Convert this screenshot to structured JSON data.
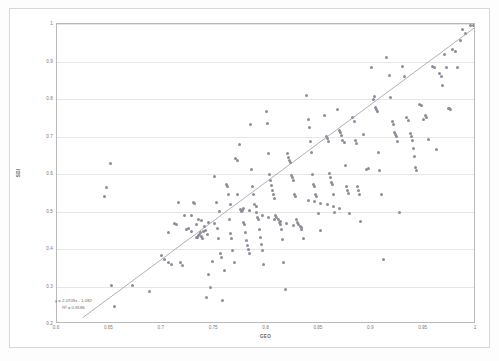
{
  "chart_data": {
    "type": "scatter",
    "title": "",
    "xlabel": "GEO",
    "ylabel": "SDI",
    "xlim": [
      0.6,
      1
    ],
    "ylim": [
      0.2,
      1
    ],
    "grid": true,
    "legend": "none",
    "x_ticks": [
      "0.6",
      "0.65",
      "0.7",
      "0.75",
      "0.8",
      "0.85",
      "0.9",
      "0.95",
      "1"
    ],
    "y_ticks": [
      "0.2",
      "0.3",
      "0.4",
      "0.5",
      "0.6",
      "0.7",
      "0.8",
      "0.9",
      "1"
    ],
    "marker_color": "#8d8d99",
    "trendline_color": "#9a9aa6",
    "gridline_color": "#e6e6e6",
    "annotations": {
      "equation": "y = 2.0709x - 1.082",
      "r_squared": "R² = 0.8186"
    },
    "trendline": {
      "type": "linear",
      "slope": 2.0709,
      "intercept": -1.082,
      "x_start": 0.6245,
      "x_end": 1.0
    },
    "points": [
      [
        0.651,
        0.628
      ],
      [
        0.647,
        0.565
      ],
      [
        0.645,
        0.54
      ],
      [
        0.652,
        0.303
      ],
      [
        0.655,
        0.247
      ],
      [
        0.655,
        0.201
      ],
      [
        0.672,
        0.302
      ],
      [
        0.688,
        0.288
      ],
      [
        0.7,
        0.382
      ],
      [
        0.703,
        0.371
      ],
      [
        0.706,
        0.363
      ],
      [
        0.709,
        0.359
      ],
      [
        0.712,
        0.469
      ],
      [
        0.714,
        0.466
      ],
      [
        0.716,
        0.525
      ],
      [
        0.718,
        0.364
      ],
      [
        0.72,
        0.356
      ],
      [
        0.722,
        0.49
      ],
      [
        0.724,
        0.452
      ],
      [
        0.726,
        0.455
      ],
      [
        0.728,
        0.448
      ],
      [
        0.73,
        0.525
      ],
      [
        0.731,
        0.522
      ],
      [
        0.733,
        0.432
      ],
      [
        0.734,
        0.43
      ],
      [
        0.735,
        0.437
      ],
      [
        0.736,
        0.44
      ],
      [
        0.737,
        0.443
      ],
      [
        0.738,
        0.434
      ],
      [
        0.739,
        0.429
      ],
      [
        0.74,
        0.447
      ],
      [
        0.741,
        0.459
      ],
      [
        0.742,
        0.45
      ],
      [
        0.743,
        0.27
      ],
      [
        0.745,
        0.333
      ],
      [
        0.747,
        0.298
      ],
      [
        0.748,
        0.368
      ],
      [
        0.75,
        0.594
      ],
      [
        0.752,
        0.525
      ],
      [
        0.753,
        0.455
      ],
      [
        0.754,
        0.429
      ],
      [
        0.756,
        0.389
      ],
      [
        0.757,
        0.378
      ],
      [
        0.758,
        0.262
      ],
      [
        0.76,
        0.343
      ],
      [
        0.762,
        0.573
      ],
      [
        0.763,
        0.566
      ],
      [
        0.764,
        0.545
      ],
      [
        0.765,
        0.478
      ],
      [
        0.766,
        0.441
      ],
      [
        0.767,
        0.428
      ],
      [
        0.768,
        0.396
      ],
      [
        0.769,
        0.363
      ],
      [
        0.77,
        0.642
      ],
      [
        0.772,
        0.637
      ],
      [
        0.774,
        0.679
      ],
      [
        0.775,
        0.506
      ],
      [
        0.776,
        0.5
      ],
      [
        0.777,
        0.503
      ],
      [
        0.778,
        0.472
      ],
      [
        0.779,
        0.465
      ],
      [
        0.78,
        0.443
      ],
      [
        0.781,
        0.423
      ],
      [
        0.782,
        0.409
      ],
      [
        0.783,
        0.398
      ],
      [
        0.784,
        0.387
      ],
      [
        0.785,
        0.733
      ],
      [
        0.786,
        0.613
      ],
      [
        0.787,
        0.568
      ],
      [
        0.788,
        0.545
      ],
      [
        0.789,
        0.519
      ],
      [
        0.79,
        0.513
      ],
      [
        0.791,
        0.485
      ],
      [
        0.792,
        0.478
      ],
      [
        0.793,
        0.452
      ],
      [
        0.794,
        0.432
      ],
      [
        0.795,
        0.411
      ],
      [
        0.796,
        0.395
      ],
      [
        0.797,
        0.36
      ],
      [
        0.8,
        0.766
      ],
      [
        0.801,
        0.735
      ],
      [
        0.802,
        0.654
      ],
      [
        0.803,
        0.6
      ],
      [
        0.804,
        0.583
      ],
      [
        0.805,
        0.57
      ],
      [
        0.806,
        0.556
      ],
      [
        0.807,
        0.545
      ],
      [
        0.808,
        0.536
      ],
      [
        0.809,
        0.49
      ],
      [
        0.81,
        0.484
      ],
      [
        0.811,
        0.478
      ],
      [
        0.812,
        0.472
      ],
      [
        0.813,
        0.465
      ],
      [
        0.814,
        0.452
      ],
      [
        0.815,
        0.425
      ],
      [
        0.816,
        0.365
      ],
      [
        0.818,
        0.292
      ],
      [
        0.82,
        0.656
      ],
      [
        0.821,
        0.643
      ],
      [
        0.822,
        0.636
      ],
      [
        0.823,
        0.63
      ],
      [
        0.824,
        0.597
      ],
      [
        0.825,
        0.59
      ],
      [
        0.826,
        0.584
      ],
      [
        0.827,
        0.545
      ],
      [
        0.828,
        0.54
      ],
      [
        0.829,
        0.478
      ],
      [
        0.83,
        0.472
      ],
      [
        0.831,
        0.465
      ],
      [
        0.832,
        0.459
      ],
      [
        0.833,
        0.452
      ],
      [
        0.835,
        0.427
      ],
      [
        0.838,
        0.81
      ],
      [
        0.84,
        0.745
      ],
      [
        0.841,
        0.724
      ],
      [
        0.842,
        0.686
      ],
      [
        0.843,
        0.658
      ],
      [
        0.844,
        0.6
      ],
      [
        0.845,
        0.573
      ],
      [
        0.846,
        0.566
      ],
      [
        0.847,
        0.545
      ],
      [
        0.848,
        0.539
      ],
      [
        0.85,
        0.494
      ],
      [
        0.852,
        0.45
      ],
      [
        0.855,
        0.757
      ],
      [
        0.857,
        0.7
      ],
      [
        0.858,
        0.694
      ],
      [
        0.859,
        0.688
      ],
      [
        0.86,
        0.601
      ],
      [
        0.861,
        0.59
      ],
      [
        0.862,
        0.578
      ],
      [
        0.863,
        0.572
      ],
      [
        0.864,
        0.545
      ],
      [
        0.865,
        0.497
      ],
      [
        0.868,
        0.772
      ],
      [
        0.87,
        0.716
      ],
      [
        0.871,
        0.71
      ],
      [
        0.872,
        0.703
      ],
      [
        0.873,
        0.69
      ],
      [
        0.874,
        0.684
      ],
      [
        0.875,
        0.622
      ],
      [
        0.876,
        0.566
      ],
      [
        0.877,
        0.556
      ],
      [
        0.878,
        0.547
      ],
      [
        0.879,
        0.496
      ],
      [
        0.882,
        0.752
      ],
      [
        0.884,
        0.74
      ],
      [
        0.885,
        0.69
      ],
      [
        0.886,
        0.682
      ],
      [
        0.887,
        0.566
      ],
      [
        0.888,
        0.556
      ],
      [
        0.889,
        0.545
      ],
      [
        0.89,
        0.473
      ],
      [
        0.893,
        0.706
      ],
      [
        0.895,
        0.613
      ],
      [
        0.897,
        0.615
      ],
      [
        0.9,
        0.885
      ],
      [
        0.902,
        0.8
      ],
      [
        0.903,
        0.806
      ],
      [
        0.904,
        0.777
      ],
      [
        0.905,
        0.772
      ],
      [
        0.906,
        0.766
      ],
      [
        0.907,
        0.658
      ],
      [
        0.908,
        0.61
      ],
      [
        0.91,
        0.546
      ],
      [
        0.912,
        0.371
      ],
      [
        0.915,
        0.91
      ],
      [
        0.917,
        0.862
      ],
      [
        0.918,
        0.805
      ],
      [
        0.92,
        0.74
      ],
      [
        0.921,
        0.733
      ],
      [
        0.922,
        0.712
      ],
      [
        0.923,
        0.706
      ],
      [
        0.924,
        0.7
      ],
      [
        0.925,
        0.688
      ],
      [
        0.927,
        0.498
      ],
      [
        0.93,
        0.886
      ],
      [
        0.932,
        0.86
      ],
      [
        0.934,
        0.75
      ],
      [
        0.936,
        0.744
      ],
      [
        0.937,
        0.707
      ],
      [
        0.938,
        0.7
      ],
      [
        0.939,
        0.69
      ],
      [
        0.94,
        0.667
      ],
      [
        0.941,
        0.646
      ],
      [
        0.942,
        0.617
      ],
      [
        0.943,
        0.61
      ],
      [
        0.946,
        0.786
      ],
      [
        0.948,
        0.782
      ],
      [
        0.95,
        0.746
      ],
      [
        0.952,
        0.755
      ],
      [
        0.953,
        0.75
      ],
      [
        0.955,
        0.693
      ],
      [
        0.958,
        0.886
      ],
      [
        0.96,
        0.884
      ],
      [
        0.962,
        0.666
      ],
      [
        0.965,
        0.867
      ],
      [
        0.967,
        0.86
      ],
      [
        0.968,
        0.835
      ],
      [
        0.97,
        0.92
      ],
      [
        0.972,
        0.884
      ],
      [
        0.974,
        0.776
      ],
      [
        0.975,
        0.775
      ],
      [
        0.976,
        0.773
      ],
      [
        0.978,
        0.933
      ],
      [
        0.98,
        0.927
      ],
      [
        0.982,
        0.884
      ],
      [
        0.985,
        0.955
      ],
      [
        0.987,
        0.985
      ],
      [
        0.99,
        0.975
      ],
      [
        0.995,
        0.995
      ],
      [
        0.998,
        0.997
      ],
      [
        0.706,
        0.443
      ],
      [
        0.733,
        0.465
      ],
      [
        0.744,
        0.44
      ],
      [
        0.755,
        0.5
      ],
      [
        0.766,
        0.52
      ],
      [
        0.772,
        0.545
      ],
      [
        0.778,
        0.508
      ],
      [
        0.784,
        0.503
      ],
      [
        0.79,
        0.498
      ],
      [
        0.796,
        0.49
      ],
      [
        0.802,
        0.484
      ],
      [
        0.808,
        0.478
      ],
      [
        0.813,
        0.473
      ],
      [
        0.819,
        0.467
      ],
      [
        0.826,
        0.462
      ],
      [
        0.833,
        0.457
      ],
      [
        0.84,
        0.53
      ],
      [
        0.846,
        0.527
      ],
      [
        0.852,
        0.522
      ],
      [
        0.858,
        0.518
      ],
      [
        0.864,
        0.513
      ],
      [
        0.87,
        0.508
      ],
      [
        0.745,
        0.471
      ],
      [
        0.75,
        0.467
      ],
      [
        0.738,
        0.475
      ],
      [
        0.735,
        0.48
      ],
      [
        0.728,
        0.49
      ]
    ]
  }
}
